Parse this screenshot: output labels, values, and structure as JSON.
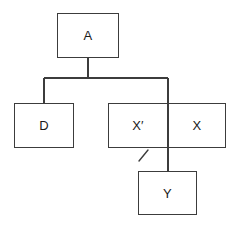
{
  "diagram": {
    "type": "tree-hierarchy",
    "title": "",
    "background_color": "#ffffff",
    "line_color": "#3c3c3c",
    "text_color": "#1a1a1a",
    "nodes": [
      {
        "id": "a",
        "label": "A",
        "role": "root"
      },
      {
        "id": "d",
        "label": "D",
        "role": "child"
      },
      {
        "id": "xprime",
        "label": "X′",
        "role": "child-cell-left"
      },
      {
        "id": "x",
        "label": "X",
        "role": "child-cell-right"
      },
      {
        "id": "y",
        "label": "Y",
        "role": "descendant"
      }
    ],
    "split_box": {
      "cells": [
        {
          "id": "xprime",
          "label": "X′"
        },
        {
          "id": "x",
          "label": "X"
        }
      ]
    },
    "edges": [
      {
        "from": "a",
        "to": "bus",
        "kind": "vertical"
      },
      {
        "from": "bus",
        "to": "d",
        "kind": "elbow"
      },
      {
        "from": "bus",
        "to": "y",
        "kind": "elbow-through-split"
      }
    ],
    "annotations": [
      {
        "id": "slash",
        "symbol": "/",
        "description": "diagonal slash mark below X-prime cell"
      }
    ]
  }
}
